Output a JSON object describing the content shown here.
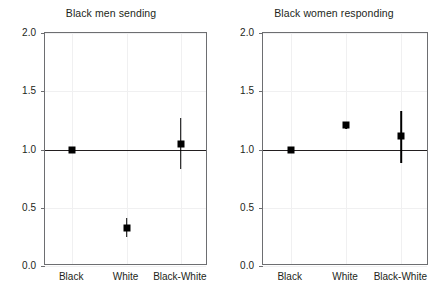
{
  "chart_data": {
    "type": "scatter",
    "layout": "two-panel",
    "ylim": [
      0.0,
      2.0
    ],
    "yticks": [
      0.0,
      0.5,
      1.0,
      1.5,
      2.0
    ],
    "ytick_labels": [
      "0.0",
      "0.5",
      "1.0",
      "1.5",
      "2.0"
    ],
    "categories": [
      "Black",
      "White",
      "Black-White"
    ],
    "grid": true,
    "legend": "none",
    "reference_line": 1.0,
    "xlabel": "",
    "ylabel": "",
    "panels": [
      {
        "title": "Black men sending",
        "points": [
          {
            "category": "Black",
            "value": 1.0,
            "low": 1.0,
            "high": 1.0
          },
          {
            "category": "White",
            "value": 0.33,
            "low": 0.25,
            "high": 0.41
          },
          {
            "category": "Black-White",
            "value": 1.05,
            "low": 0.83,
            "high": 1.27
          }
        ]
      },
      {
        "title": "Black women responding",
        "points": [
          {
            "category": "Black",
            "value": 1.0,
            "low": 1.0,
            "high": 1.0
          },
          {
            "category": "White",
            "value": 1.21,
            "low": 1.18,
            "high": 1.24
          },
          {
            "category": "Black-White",
            "value": 1.12,
            "low": 0.88,
            "high": 1.33
          }
        ]
      }
    ]
  },
  "colors": {
    "marker": "#000000",
    "frame": "#6d6e71",
    "grid": "#f0f0f1",
    "reference_line": "#231f20",
    "text": "#231f20",
    "background": "#ffffff"
  }
}
